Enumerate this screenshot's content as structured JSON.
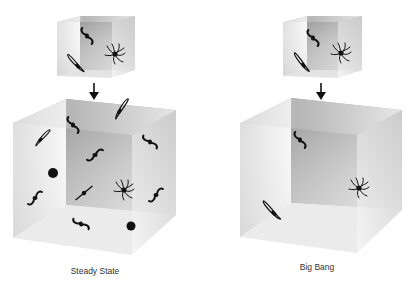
{
  "diagrams": [
    {
      "id": "steady-state",
      "caption": "Steady State",
      "small_cube_objects": [
        "spiral-galaxy",
        "edge-on-galaxy",
        "barred-galaxy"
      ],
      "large_cube_objects": [
        "edge-on-galaxy",
        "barred-galaxy",
        "barred-galaxy",
        "barred-galaxy",
        "dot",
        "spiral-galaxy",
        "edge-on-galaxy",
        "barred-galaxy",
        "dot",
        "edge-on-galaxy",
        "barred-galaxy"
      ]
    },
    {
      "id": "big-bang",
      "caption": "Big Bang",
      "small_cube_objects": [
        "spiral-galaxy",
        "edge-on-galaxy",
        "barred-galaxy"
      ],
      "large_cube_objects": [
        "barred-galaxy",
        "spiral-galaxy",
        "edge-on-galaxy"
      ]
    }
  ],
  "arrow_icon": "down-arrow",
  "colors": {
    "ink": "#111111",
    "face_dark": "#8a8a8a",
    "face_light": "#f4f4f4",
    "caption": "#333333"
  }
}
